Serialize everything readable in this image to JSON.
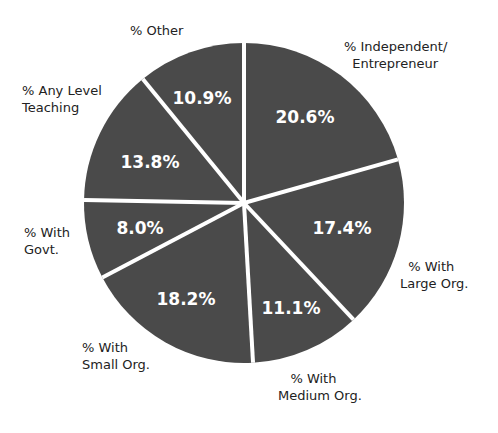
{
  "chart_data": {
    "type": "pie",
    "title": "",
    "start_angle_deg": 0,
    "direction": "clockwise",
    "slice_color": "#4a4a4a",
    "separator_color": "#ffffff",
    "slices": [
      {
        "label": "% Independent/\nEntrepreneur",
        "value": 20.6,
        "display": "20.6%"
      },
      {
        "label": "% With\nLarge Org.",
        "value": 17.4,
        "display": "17.4%"
      },
      {
        "label": "% With\nMedium Org.",
        "value": 11.1,
        "display": "11.1%"
      },
      {
        "label": "% With\nSmall Org.",
        "value": 18.2,
        "display": "18.2%"
      },
      {
        "label": "% With\nGovt.",
        "value": 8.0,
        "display": "8.0%"
      },
      {
        "label": "% Any Level\nTeaching",
        "value": 13.8,
        "display": "13.8%"
      },
      {
        "label": "% Other",
        "value": 10.9,
        "display": "10.9%"
      }
    ]
  },
  "labels": {
    "independent": "% Independent/\n  Entrepreneur",
    "large": "  % With\nLarge Org.",
    "medium": "   % With\nMedium Org.",
    "small": "% With\nSmall Org.",
    "govt": "% With\nGovt.",
    "teaching": "% Any Level\nTeaching",
    "other": "% Other"
  },
  "values": {
    "independent": "20.6%",
    "large": "17.4%",
    "medium": "11.1%",
    "small": "18.2%",
    "govt": "8.0%",
    "teaching": "13.8%",
    "other": "10.9%"
  }
}
